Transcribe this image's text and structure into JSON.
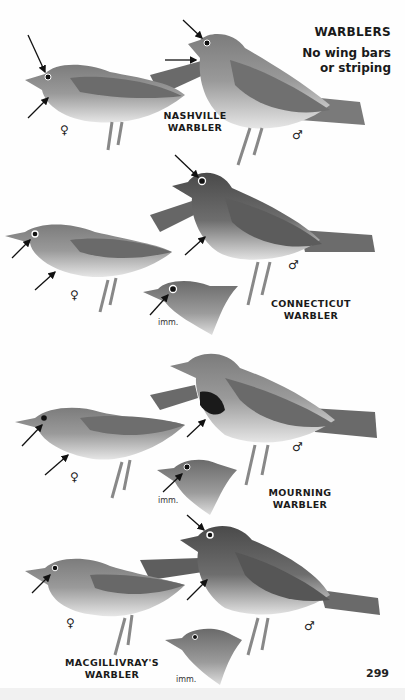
{
  "header": {
    "title": "WARBLERS",
    "subtitle_line1": "No wing bars",
    "subtitle_line2": "or striping"
  },
  "plates": [
    {
      "species_line1": "NASHVILLE",
      "species_line2": "WARBLER",
      "female_symbol": "♀",
      "male_symbol": "♂"
    },
    {
      "species_line1": "CONNECTICUT",
      "species_line2": "WARBLER",
      "female_symbol": "♀",
      "male_symbol": "♂",
      "immature_label": "imm."
    },
    {
      "species_line1": "MOURNING",
      "species_line2": "WARBLER",
      "female_symbol": "♀",
      "male_symbol": "♂",
      "immature_label": "imm."
    },
    {
      "species_line1": "MACGILLIVRAY'S",
      "species_line2": "WARBLER",
      "female_symbol": "♀",
      "male_symbol": "♂",
      "immature_label": "imm."
    }
  ],
  "page_number": "299",
  "colors": {
    "background": "#fefefe",
    "text": "#1a1a1a",
    "bird_dark": "#5a5a5a",
    "bird_mid": "#8a8a8a",
    "bird_light": "#e4e4e4"
  }
}
